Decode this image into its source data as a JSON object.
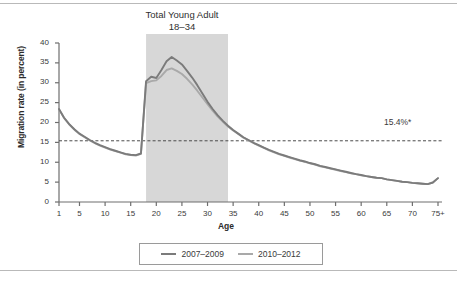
{
  "figure": {
    "title_lines": [
      "Total Young Adult",
      "18–34"
    ],
    "x_axis_title": "Age",
    "y_axis_title": "Migration rate (in percent)",
    "reference_label": "15.4%*",
    "reference_value": 15.4,
    "band_label": "Total Young Adult 18–34",
    "colors": {
      "series_2007_2009": "#7b7b7b",
      "series_2010_2012": "#a9a9a9",
      "band_fill": "#d7d7d7",
      "axis": "#6e6e6e",
      "reference_line": "#4a4a4a",
      "frame_rule": "#b9b9b9"
    }
  },
  "legend": {
    "position": "bottom-center",
    "entries": [
      {
        "label": "2007–2009",
        "color": "#7b7b7b"
      },
      {
        "label": "2010–2012",
        "color": "#a9a9a9"
      }
    ]
  },
  "chart_data": {
    "type": "line",
    "title": "Total Young Adult 18–34",
    "xlabel": "Age",
    "ylabel": "Migration rate (in percent)",
    "xlim": [
      1,
      75
    ],
    "ylim": [
      0,
      40
    ],
    "grid": false,
    "ytick_labels": [
      "0",
      "5",
      "10",
      "15",
      "20",
      "25",
      "30",
      "35",
      "40"
    ],
    "ytick_values": [
      0,
      5,
      10,
      15,
      20,
      25,
      30,
      35,
      40
    ],
    "xtick_labels": [
      "1",
      "5",
      "10",
      "15",
      "20",
      "25",
      "30",
      "35",
      "40",
      "45",
      "50",
      "55",
      "60",
      "65",
      "70",
      "75+"
    ],
    "xtick_values": [
      1,
      5,
      10,
      15,
      20,
      25,
      30,
      35,
      40,
      45,
      50,
      55,
      60,
      65,
      70,
      75
    ],
    "annotations": [
      {
        "text": "15.4%*",
        "type": "reference-line",
        "y": 15.4,
        "style": "dashed"
      },
      {
        "text": "Total Young Adult 18–34",
        "type": "shaded-band",
        "x_start": 18,
        "x_end": 34
      }
    ],
    "x": [
      1,
      2,
      3,
      4,
      5,
      6,
      7,
      8,
      9,
      10,
      11,
      12,
      13,
      14,
      15,
      16,
      17,
      18,
      19,
      20,
      21,
      22,
      23,
      24,
      25,
      26,
      27,
      28,
      29,
      30,
      31,
      32,
      33,
      34,
      35,
      36,
      37,
      38,
      39,
      40,
      41,
      42,
      43,
      44,
      45,
      46,
      47,
      48,
      49,
      50,
      51,
      52,
      53,
      54,
      55,
      56,
      57,
      58,
      59,
      60,
      61,
      62,
      63,
      64,
      65,
      66,
      67,
      68,
      69,
      70,
      71,
      72,
      73,
      74,
      75
    ],
    "series": [
      {
        "name": "2007–2009",
        "color": "#7b7b7b",
        "values": [
          23.4,
          21.2,
          19.6,
          18.3,
          17.2,
          16.4,
          15.6,
          14.9,
          14.3,
          13.8,
          13.3,
          12.9,
          12.5,
          12.1,
          11.9,
          11.8,
          12.2,
          30.4,
          31.5,
          31.2,
          33.2,
          35.4,
          36.5,
          35.6,
          34.6,
          33.0,
          31.3,
          29.4,
          27.3,
          25.2,
          23.4,
          21.8,
          20.4,
          19.2,
          18.1,
          17.2,
          16.3,
          15.6,
          14.9,
          14.3,
          13.7,
          13.1,
          12.6,
          12.1,
          11.7,
          11.3,
          10.9,
          10.5,
          10.2,
          9.8,
          9.5,
          9.1,
          8.8,
          8.5,
          8.2,
          7.9,
          7.6,
          7.3,
          7.0,
          6.8,
          6.5,
          6.3,
          6.1,
          6.0,
          5.7,
          5.5,
          5.3,
          5.1,
          5.0,
          4.8,
          4.7,
          4.6,
          4.5,
          4.9,
          6.0
        ]
      },
      {
        "name": "2010–2012",
        "color": "#a9a9a9",
        "values": [
          23.3,
          21.1,
          19.5,
          18.2,
          17.1,
          16.3,
          15.5,
          14.8,
          14.2,
          13.7,
          13.2,
          12.8,
          12.4,
          12.0,
          11.8,
          11.7,
          12.1,
          29.9,
          30.4,
          30.6,
          31.7,
          33.2,
          33.6,
          33.0,
          32.2,
          31.0,
          29.6,
          28.0,
          26.3,
          24.6,
          23.0,
          21.5,
          20.2,
          19.0,
          18.0,
          17.1,
          16.2,
          15.5,
          14.8,
          14.2,
          13.6,
          13.0,
          12.5,
          12.0,
          11.6,
          11.2,
          10.8,
          10.4,
          10.1,
          9.7,
          9.4,
          9.0,
          8.7,
          8.4,
          8.1,
          7.8,
          7.5,
          7.2,
          7.0,
          6.7,
          6.5,
          6.3,
          6.1,
          6.0,
          5.7,
          5.5,
          5.3,
          5.1,
          5.0,
          4.8,
          4.7,
          4.6,
          4.5,
          4.9,
          6.0
        ]
      }
    ]
  }
}
